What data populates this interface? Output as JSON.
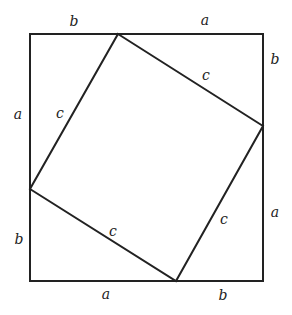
{
  "diagram": {
    "stroke_color": "#222222",
    "outer_square": {
      "x1": 30,
      "y1": 34,
      "x2": 263,
      "y2": 281
    },
    "inner_square": [
      [
        118,
        34
      ],
      [
        263,
        126
      ],
      [
        176,
        281
      ],
      [
        30,
        189
      ]
    ],
    "labels": [
      {
        "text": "b",
        "x": 74,
        "y": 21
      },
      {
        "text": "a",
        "x": 205,
        "y": 20
      },
      {
        "text": "b",
        "x": 275,
        "y": 59
      },
      {
        "text": "c",
        "x": 206,
        "y": 75
      },
      {
        "text": "a",
        "x": 18,
        "y": 114
      },
      {
        "text": "c",
        "x": 60,
        "y": 113
      },
      {
        "text": "a",
        "x": 275,
        "y": 212
      },
      {
        "text": "c",
        "x": 224,
        "y": 219
      },
      {
        "text": "b",
        "x": 19,
        "y": 239
      },
      {
        "text": "c",
        "x": 113,
        "y": 231
      },
      {
        "text": "a",
        "x": 106,
        "y": 294
      },
      {
        "text": "b",
        "x": 223,
        "y": 295
      }
    ]
  }
}
